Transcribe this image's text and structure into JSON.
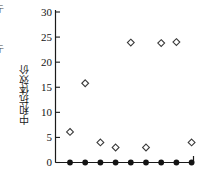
{
  "chart_data": {
    "type": "scatter",
    "title": "",
    "xlabel": "",
    "ylabel": "中和抗体效价",
    "ylim": [
      0,
      30
    ],
    "yticks": [
      0,
      5,
      10,
      15,
      20,
      25,
      30
    ],
    "ytick_labels": [
      "0",
      "5",
      "10",
      "15",
      "20",
      "25",
      "30"
    ],
    "grid": false,
    "legend": null,
    "x": [
      1,
      2,
      3,
      4,
      5,
      6,
      7,
      8,
      9
    ],
    "series": [
      {
        "name": "中和抗体效价",
        "marker": "open-diamond",
        "color": "#3a3a3a",
        "values": [
          6.1,
          15.8,
          4.0,
          3.0,
          23.9,
          3.0,
          23.8,
          24.0,
          4.0
        ]
      },
      {
        "name": "基线",
        "marker": "filled-circle",
        "color": "#141414",
        "values": [
          0,
          0,
          0,
          0,
          0,
          0,
          0,
          0,
          0
        ]
      }
    ]
  },
  "axis": {
    "y_title": "中和抗体效价",
    "tick_0": "0",
    "tick_5": "5",
    "tick_10": "10",
    "tick_15": "15",
    "tick_20": "20",
    "tick_25": "25",
    "tick_30": "30"
  },
  "edge_fragments": {
    "f1": "亍",
    "f2": "：",
    "f3": "亍",
    "f4": "·",
    "f5": "▌",
    "f6": "▏",
    "f7": "-"
  }
}
